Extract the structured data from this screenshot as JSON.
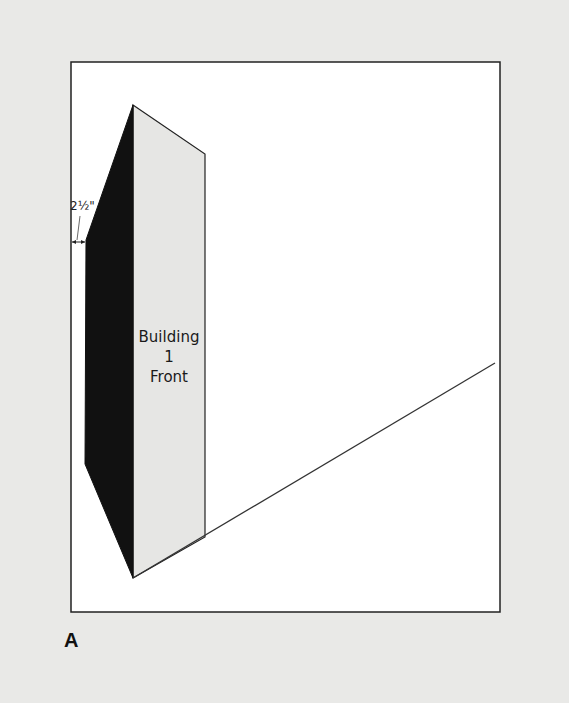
{
  "figure": {
    "label": "A",
    "dimension_label": "2½\"",
    "building": {
      "line1": "Building",
      "line2": "1",
      "line3": "Front"
    },
    "colors": {
      "background": "#e9e9e7",
      "frame_fill": "#ffffff",
      "front_face": "#e6e6e4",
      "side_face": "#111111",
      "stroke": "#222222"
    },
    "geometry": {
      "frame": {
        "x1": 71,
        "y1": 62,
        "x2": 500,
        "y2": 612
      },
      "front_face": [
        [
          133,
          105
        ],
        [
          205,
          154
        ],
        [
          205,
          537
        ],
        [
          133,
          578
        ]
      ],
      "side_face": [
        [
          133,
          105
        ],
        [
          86,
          240
        ],
        [
          85,
          464
        ],
        [
          133,
          578
        ]
      ],
      "perspective_line": [
        [
          133,
          578
        ],
        [
          495,
          363
        ]
      ],
      "dimension_arrow": {
        "x1": 72,
        "x2": 85,
        "y": 242
      }
    }
  }
}
